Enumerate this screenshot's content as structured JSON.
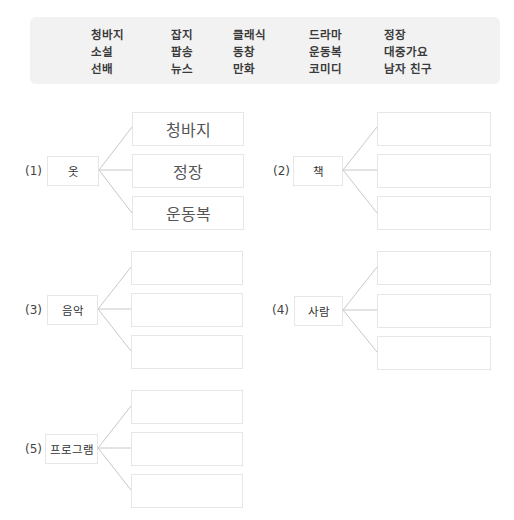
{
  "word_bank": {
    "columns": [
      [
        "청바지",
        "소설",
        "선배"
      ],
      [
        "잡지",
        "팝송",
        "뉴스"
      ],
      [
        "클래식",
        "동창",
        "만화"
      ],
      [
        "드라마",
        "운동복",
        "코미디"
      ],
      [
        "정장",
        "대중가요",
        "남자 친구"
      ]
    ]
  },
  "groups": [
    {
      "number": "(1)",
      "category": "옷",
      "answers": [
        "청바지",
        "정장",
        "운동복"
      ]
    },
    {
      "number": "(2)",
      "category": "책",
      "answers": [
        "",
        "",
        ""
      ]
    },
    {
      "number": "(3)",
      "category": "음악",
      "answers": [
        "",
        "",
        ""
      ]
    },
    {
      "number": "(4)",
      "category": "사람",
      "answers": [
        "",
        "",
        ""
      ]
    },
    {
      "number": "(5)",
      "category": "프로그램",
      "answers": [
        "",
        "",
        ""
      ]
    }
  ]
}
